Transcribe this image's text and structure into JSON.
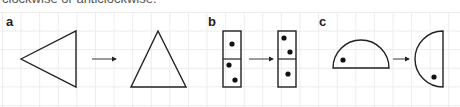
{
  "caption": "clockwise or anticlockwise.",
  "panels": [
    {
      "label": "a",
      "before": "triangle pointing left",
      "after": "triangle pointing up",
      "arrow": "right-arrow"
    },
    {
      "label": "b",
      "before": "vertical domino with 1 and 2 dots",
      "after": "vertical domino with 2 and 1 dots",
      "arrow": "right-arrow"
    },
    {
      "label": "c",
      "before": "semicircle dome up with dot",
      "after": "semicircle facing left with dot",
      "arrow": "right-arrow"
    }
  ]
}
